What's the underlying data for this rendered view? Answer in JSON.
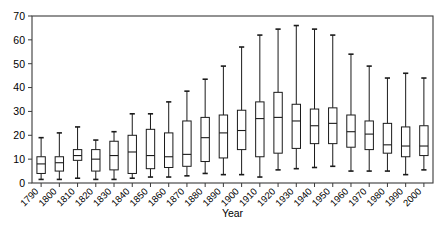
{
  "chart_data": {
    "type": "box",
    "title": "",
    "xlabel": "Year",
    "ylabel": "",
    "grid": false,
    "legend": "none",
    "xlim": [
      1785,
      2005
    ],
    "ylim": [
      0,
      70
    ],
    "yticks": [
      0,
      10,
      20,
      30,
      40,
      50,
      60,
      70
    ],
    "categories": [
      "1790",
      "1800",
      "1810",
      "1820",
      "1830",
      "1840",
      "1850",
      "1860",
      "1870",
      "1880",
      "1890",
      "1900",
      "1910",
      "1920",
      "1930",
      "1940",
      "1950",
      "1960",
      "1970",
      "1980",
      "1990",
      "2000"
    ],
    "boxes": [
      {
        "category": "1790",
        "min": 1.5,
        "q1": 4.0,
        "median": 8.0,
        "q3": 11.0,
        "max": 19.0
      },
      {
        "category": "1800",
        "min": 1.5,
        "q1": 5.0,
        "median": 8.5,
        "q3": 11.0,
        "max": 21.0
      },
      {
        "category": "1810",
        "min": 2.0,
        "q1": 9.5,
        "median": 11.5,
        "q3": 14.0,
        "max": 23.5
      },
      {
        "category": "1820",
        "min": 1.5,
        "q1": 5.0,
        "median": 10.0,
        "q3": 14.0,
        "max": 18.0
      },
      {
        "category": "1830",
        "min": 1.5,
        "q1": 5.5,
        "median": 11.5,
        "q3": 17.5,
        "max": 21.5
      },
      {
        "category": "1840",
        "min": 2.0,
        "q1": 4.0,
        "median": 13.0,
        "q3": 20.0,
        "max": 29.0
      },
      {
        "category": "1850",
        "min": 2.5,
        "q1": 6.0,
        "median": 11.5,
        "q3": 22.5,
        "max": 29.0
      },
      {
        "category": "1860",
        "min": 2.5,
        "q1": 6.5,
        "median": 11.0,
        "q3": 21.0,
        "max": 34.0
      },
      {
        "category": "1870",
        "min": 3.0,
        "q1": 7.0,
        "median": 12.0,
        "q3": 26.0,
        "max": 38.5
      },
      {
        "category": "1880",
        "min": 4.0,
        "q1": 9.0,
        "median": 19.0,
        "q3": 27.5,
        "max": 43.5
      },
      {
        "category": "1890",
        "min": 3.5,
        "q1": 10.5,
        "median": 21.0,
        "q3": 28.5,
        "max": 49.0
      },
      {
        "category": "1900",
        "min": 3.5,
        "q1": 14.0,
        "median": 22.0,
        "q3": 30.5,
        "max": 57.0
      },
      {
        "category": "1910",
        "min": 2.5,
        "q1": 11.0,
        "median": 27.0,
        "q3": 34.0,
        "max": 62.0
      },
      {
        "category": "1920",
        "min": 5.5,
        "q1": 12.5,
        "median": 27.5,
        "q3": 38.0,
        "max": 64.5
      },
      {
        "category": "1930",
        "min": 6.0,
        "q1": 14.5,
        "median": 26.0,
        "q3": 33.0,
        "max": 66.0
      },
      {
        "category": "1940",
        "min": 6.5,
        "q1": 16.5,
        "median": 24.0,
        "q3": 31.0,
        "max": 64.5
      },
      {
        "category": "1950",
        "min": 7.0,
        "q1": 16.5,
        "median": 25.0,
        "q3": 31.5,
        "max": 62.0
      },
      {
        "category": "1960",
        "min": 5.0,
        "q1": 15.0,
        "median": 21.5,
        "q3": 28.5,
        "max": 54.0
      },
      {
        "category": "1970",
        "min": 5.0,
        "q1": 14.0,
        "median": 20.5,
        "q3": 26.0,
        "max": 49.0
      },
      {
        "category": "1980",
        "min": 5.0,
        "q1": 12.5,
        "median": 16.0,
        "q3": 25.0,
        "max": 44.0
      },
      {
        "category": "1990",
        "min": 3.5,
        "q1": 11.0,
        "median": 15.5,
        "q3": 23.5,
        "max": 46.0
      },
      {
        "category": "2000",
        "min": 5.5,
        "q1": 11.5,
        "median": 15.5,
        "q3": 24.0,
        "max": 44.0
      }
    ]
  },
  "axes": {
    "x_title": "Year",
    "y_title": ""
  },
  "colors": {
    "frame": "#3a3a3a",
    "box_stroke": "#1a1a1a",
    "box_fill": "#ffffff",
    "background": "#ffffff"
  }
}
